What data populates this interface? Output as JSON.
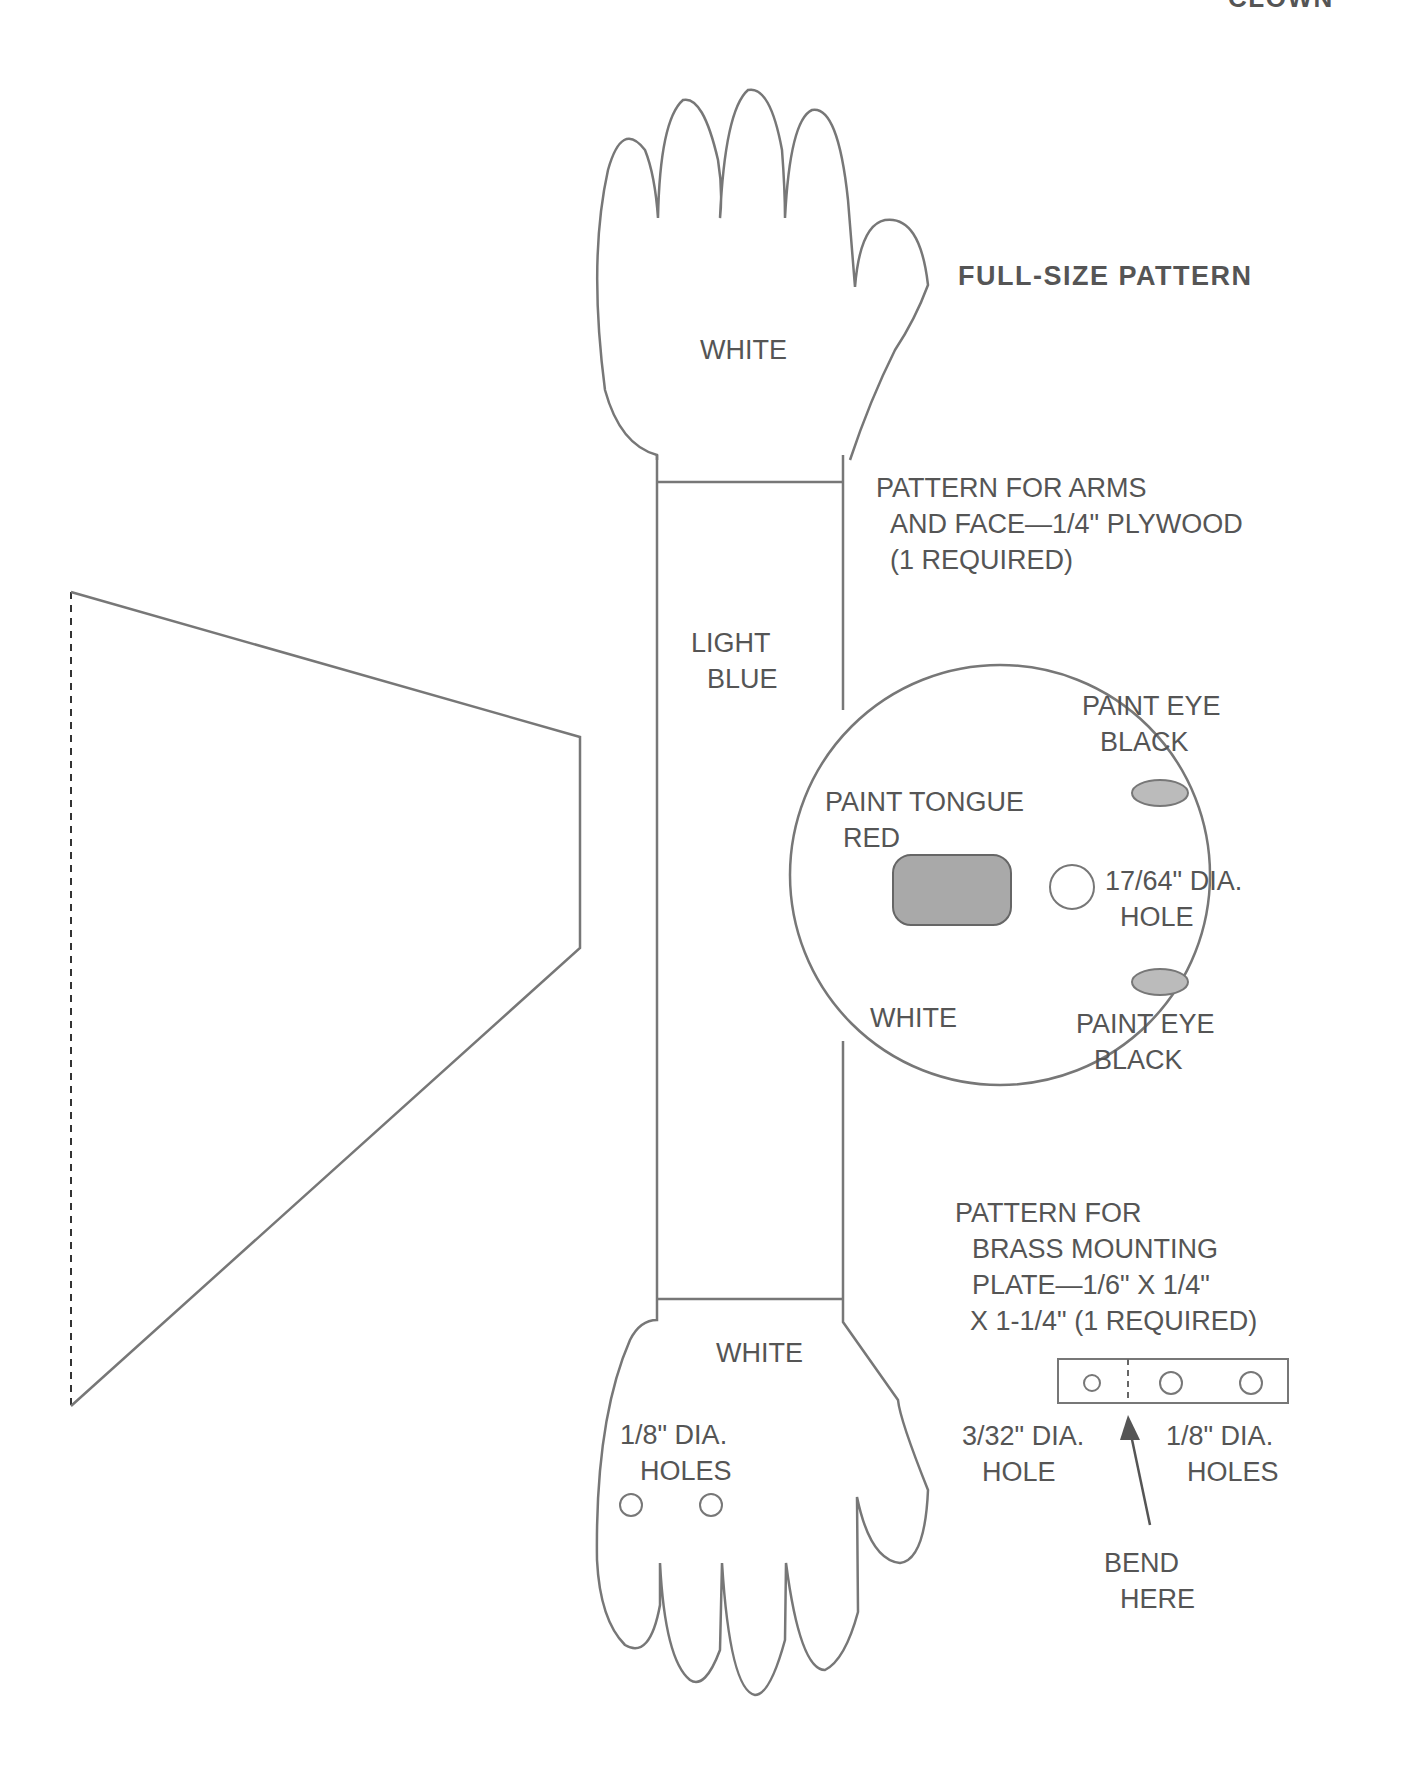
{
  "header": {
    "running_title": "CLOWN",
    "subtitle": "FULL-SIZE PATTERN"
  },
  "arm_piece": {
    "top_hand_label": "WHITE",
    "arm_label_line1": "LIGHT",
    "arm_label_line2": "BLUE",
    "bottom_hand_label": "WHITE",
    "holes_label_line1": "1/8\" DIA.",
    "holes_label_line2": "HOLES",
    "caption_line1": "PATTERN FOR ARMS",
    "caption_line2": "AND FACE—1/4\" PLYWOOD",
    "caption_line3": "(1 REQUIRED)"
  },
  "face_piece": {
    "eye_top_line1": "PAINT EYE",
    "eye_top_line2": "BLACK",
    "tongue_line1": "PAINT TONGUE",
    "tongue_line2": "RED",
    "hole_line1": "17/64\" DIA.",
    "hole_line2": "HOLE",
    "face_color": "WHITE",
    "eye_bottom_line1": "PAINT EYE",
    "eye_bottom_line2": "BLACK"
  },
  "mounting_plate": {
    "caption_line1": "PATTERN FOR",
    "caption_line2": "BRASS MOUNTING",
    "caption_line3": "PLATE—1/6\" X 1/4\"",
    "caption_line4": "X 1-1/4\" (1 REQUIRED)",
    "left_hole_line1": "3/32\" DIA.",
    "left_hole_line2": "HOLE",
    "right_holes_line1": "1/8\" DIA.",
    "right_holes_line2": "HOLES",
    "bend_line1": "BEND",
    "bend_line2": "HERE"
  },
  "colors": {
    "line": "#777777",
    "text": "#555555",
    "fill_tongue": "#a9a9a9",
    "fill_eye": "#bbbbbb"
  }
}
